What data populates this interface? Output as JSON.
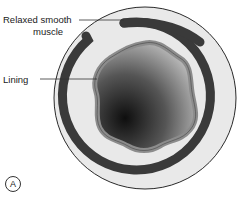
{
  "diagram": {
    "labels": {
      "muscle_line1": "Relaxed smooth",
      "muscle_line2": "muscle",
      "lining": "Lining"
    },
    "panel_letter": "A",
    "colors": {
      "outer_fill": "#e8e8e8",
      "outer_stroke": "#333333",
      "muscle_band": "#3a3a3a",
      "lining_band": "#8a8a8a",
      "lumen_dark": "#111111",
      "lumen_light": "#d8d8d8"
    }
  }
}
